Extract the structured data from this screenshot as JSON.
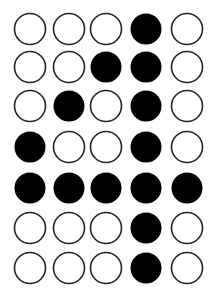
{
  "colors": {
    "filled": "#000000",
    "empty": "#ffffff",
    "stroke": "#222222"
  },
  "matrix": [
    [
      0,
      0,
      0,
      1,
      0
    ],
    [
      0,
      0,
      1,
      1,
      0
    ],
    [
      0,
      1,
      0,
      1,
      0
    ],
    [
      1,
      0,
      0,
      1,
      0
    ],
    [
      1,
      1,
      1,
      1,
      1
    ],
    [
      0,
      0,
      0,
      1,
      0
    ],
    [
      0,
      0,
      0,
      1,
      0
    ]
  ]
}
